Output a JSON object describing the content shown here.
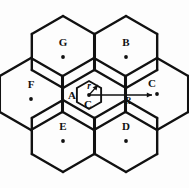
{
  "figure": {
    "type": "hexagonal-cell-cluster-diagram",
    "background_color": "#fdfdfd",
    "line_color": "#111111",
    "width": 189,
    "height": 188
  },
  "cells": [
    {
      "id": "G",
      "label": "G",
      "cx": 63,
      "cy": 52,
      "label_x": 63,
      "label_y": 43,
      "dot_x": 63,
      "dot_y": 57,
      "outer": true
    },
    {
      "id": "B",
      "label": "B",
      "cx": 126,
      "cy": 52,
      "label_x": 126,
      "label_y": 43,
      "dot_x": 126,
      "dot_y": 57,
      "outer": true
    },
    {
      "id": "F",
      "label": "F",
      "cx": 31,
      "cy": 94,
      "label_x": 31,
      "label_y": 85,
      "dot_x": 31,
      "dot_y": 99,
      "outer": true
    },
    {
      "id": "A",
      "label": "A",
      "cx": 94,
      "cy": 94,
      "label_x": 72,
      "label_y": 96,
      "dot_x": 94,
      "dot_y": 94,
      "outer": false
    },
    {
      "id": "C",
      "label": "C",
      "cx": 157,
      "cy": 94,
      "label_x": 152,
      "label_y": 84,
      "dot_x": 157,
      "dot_y": 94,
      "outer": true
    },
    {
      "id": "E",
      "label": "E",
      "cx": 63,
      "cy": 136,
      "label_x": 63,
      "label_y": 127,
      "dot_x": 63,
      "dot_y": 141,
      "outer": true
    },
    {
      "id": "D",
      "label": "D",
      "cx": 126,
      "cy": 136,
      "label_x": 126,
      "label_y": 127,
      "dot_x": 126,
      "dot_y": 141,
      "outer": true
    }
  ],
  "inner_hexagon": {
    "name": "inscribed-circle-hexagon",
    "cx": 89,
    "cy": 95,
    "radius": 14
  },
  "annotations": {
    "r_label": {
      "text": "r",
      "x": 89,
      "y": 87
    },
    "c_label": {
      "text": "C",
      "x": 88,
      "y": 105
    },
    "a_label": {
      "text": "A",
      "x": 72,
      "y": 96
    },
    "r_big_label": {
      "text": "R",
      "x": 128,
      "y": 102
    }
  },
  "vectors": {
    "small_radius": {
      "name": "r-vector",
      "from_x": 89,
      "from_y": 95,
      "to_x": 98,
      "to_y": 85
    },
    "big_radius": {
      "name": "R-vector",
      "from_x": 89,
      "from_y": 95,
      "to_x": 152,
      "to_y": 95
    }
  },
  "geometry": {
    "hex_radius": 36,
    "hex_orientation": "pointy-top"
  }
}
